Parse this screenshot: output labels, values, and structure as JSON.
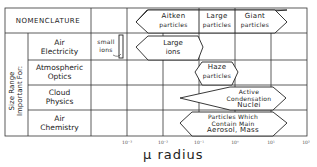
{
  "header": {
    "nomenclature": "NOMENCLATURE"
  },
  "side_label": {
    "line1": "Size Range",
    "line2": "Important For:"
  },
  "rows": [
    {
      "name": "Air Electricity",
      "line1": "Air",
      "line2": "Electricity"
    },
    {
      "name": "Atmospheric Optics",
      "line1": "Atmospheric",
      "line2": "Optics"
    },
    {
      "name": "Cloud Physics",
      "line1": "Cloud",
      "line2": "Physics"
    },
    {
      "name": "Air Chemistry",
      "line1": "Air",
      "line2": "Chemistry"
    }
  ],
  "nomenclature_shapes": [
    {
      "line1": "Aitken",
      "line2": "particles"
    },
    {
      "line1": "Large",
      "line2": "particles"
    },
    {
      "line1": "Giant",
      "line2": "particles"
    }
  ],
  "shapes": {
    "small_ions": {
      "line1": "small",
      "line2": "ions"
    },
    "large_ions": {
      "line1": "Large",
      "line2": "ions"
    },
    "haze": {
      "line1": "Haze",
      "line2": "particles"
    },
    "ccn": {
      "line1": "Active",
      "line2": "Condensation",
      "line3": "Nuclei"
    },
    "aerosol": {
      "line1": "Particles Which",
      "line2": "Contain Main",
      "line3": "Aerosol, Mass"
    }
  },
  "axis": {
    "label": "μ radius",
    "ticks": [
      "10⁻³",
      "10⁻²",
      "10⁻¹",
      "10⁰",
      "10¹",
      "10²"
    ]
  }
}
